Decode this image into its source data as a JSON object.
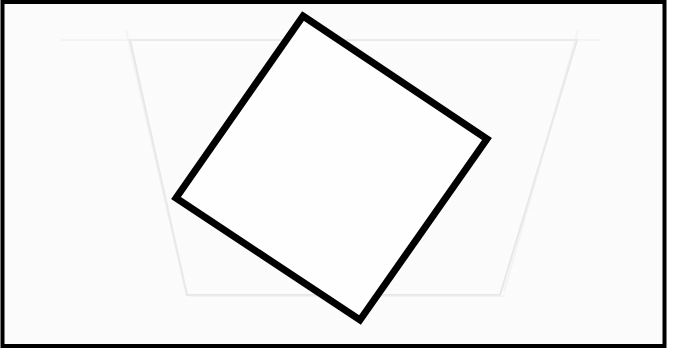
{
  "canvas": {
    "width": 673,
    "height": 353,
    "background_color": "#ffffff",
    "paper_color": "#fcfcfc"
  },
  "frame": {
    "name": "outer-border",
    "x": 2.5,
    "y": 2.0,
    "width": 662,
    "height": 344,
    "stroke_color": "#000000",
    "stroke_width": 4,
    "fill_color": "#fcfcfc"
  },
  "ghost_shape": {
    "name": "faint-trapezoid-watermark",
    "description": "very faint pencil-like trapezoid showing through from behind the page",
    "points": "130,40 577,40 500,295 187,295",
    "stroke_color": "#d8d8d8",
    "stroke_width": 2,
    "fill_color": "none",
    "opacity": 0.55
  },
  "ghost_marks": [
    {
      "name": "faint-horizontal-scan-line",
      "x1": 60,
      "y1": 40,
      "x2": 600,
      "y2": 40,
      "stroke_color": "#e2e2e2",
      "stroke_width": 2,
      "opacity": 0.5
    },
    {
      "name": "faint-horizontal-bottom-line",
      "x1": 190,
      "y1": 296,
      "x2": 505,
      "y2": 296,
      "stroke_color": "#e4e4e4",
      "stroke_width": 2,
      "opacity": 0.45
    }
  ],
  "main_shape": {
    "name": "rotated-square",
    "description": "hand-drawn black outline of a square rotated roughly 34 degrees clockwise",
    "vertices": [
      {
        "label": "top",
        "x": 303,
        "y": 16
      },
      {
        "label": "right",
        "x": 487,
        "y": 139
      },
      {
        "label": "bottom",
        "x": 360,
        "y": 320
      },
      {
        "label": "left",
        "x": 176,
        "y": 198
      }
    ],
    "points": "303,16 487,139 360,320 176,198",
    "stroke_color": "#000000",
    "stroke_width": 7,
    "fill_color": "#ffffff",
    "rotation_degrees": 34,
    "edge_length_px": 221
  }
}
